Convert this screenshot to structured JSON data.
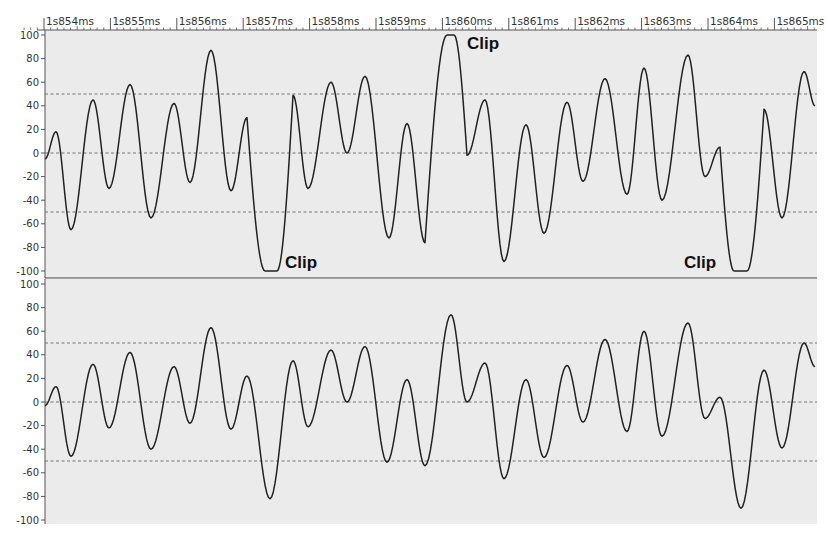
{
  "chart_data": {
    "type": "line",
    "title": "",
    "xlabel": "",
    "ylabel": "",
    "time_axis": {
      "labels": [
        "1s854ms",
        "1s855ms",
        "1s856ms",
        "1s857ms",
        "1s858ms",
        "1s859ms",
        "1s860ms",
        "1s861ms",
        "1s862ms",
        "1s863ms",
        "1s864ms",
        "1s865ms"
      ],
      "minor_ticks_per_major": 10
    },
    "grid": {
      "dashed_reference_lines": [
        50,
        0,
        -50
      ]
    },
    "panels": [
      {
        "name": "clipped-channel",
        "ylim": [
          -100,
          100
        ],
        "yticks": [
          100,
          80,
          60,
          40,
          20,
          0,
          -20,
          -40,
          -60,
          -80,
          -100
        ],
        "annotations": [
          {
            "text": "Clip",
            "at_x_px": 285,
            "at_value": -100
          },
          {
            "text": "Clip",
            "at_x_px": 467,
            "at_value": 100
          },
          {
            "text": "Clip",
            "at_x_px": 684,
            "at_value": -100
          }
        ],
        "points": [
          [
            45,
            -5
          ],
          [
            56,
            18
          ],
          [
            71,
            -65
          ],
          [
            93,
            45
          ],
          [
            109,
            -30
          ],
          [
            130,
            58
          ],
          [
            151,
            -55
          ],
          [
            174,
            42
          ],
          [
            190,
            -25
          ],
          [
            211,
            87
          ],
          [
            231,
            -32
          ],
          [
            247,
            30
          ],
          [
            265,
            -100
          ],
          [
            277,
            -100
          ],
          [
            293,
            49
          ],
          [
            308,
            -30
          ],
          [
            331,
            60
          ],
          [
            347,
            0
          ],
          [
            365,
            65
          ],
          [
            389,
            -72
          ],
          [
            407,
            25
          ],
          [
            425,
            -76
          ],
          [
            447,
            100
          ],
          [
            454,
            100
          ],
          [
            467,
            -2
          ],
          [
            485,
            45
          ],
          [
            504,
            -92
          ],
          [
            526,
            24
          ],
          [
            544,
            -68
          ],
          [
            567,
            43
          ],
          [
            583,
            -24
          ],
          [
            605,
            63
          ],
          [
            627,
            -35
          ],
          [
            644,
            72
          ],
          [
            662,
            -40
          ],
          [
            688,
            83
          ],
          [
            705,
            -20
          ],
          [
            720,
            5
          ],
          [
            734,
            -100
          ],
          [
            747,
            -100
          ],
          [
            764,
            37
          ],
          [
            782,
            -55
          ],
          [
            804,
            69
          ],
          [
            815,
            40
          ]
        ]
      },
      {
        "name": "unclipped-channel",
        "ylim": [
          -100,
          100
        ],
        "yticks": [
          100,
          80,
          60,
          40,
          20,
          0,
          -20,
          -40,
          -60,
          -80,
          -100
        ],
        "annotations": [],
        "points": [
          [
            45,
            -3
          ],
          [
            56,
            13
          ],
          [
            71,
            -46
          ],
          [
            93,
            32
          ],
          [
            109,
            -22
          ],
          [
            130,
            42
          ],
          [
            151,
            -40
          ],
          [
            174,
            30
          ],
          [
            190,
            -18
          ],
          [
            211,
            63
          ],
          [
            231,
            -23
          ],
          [
            247,
            22
          ],
          [
            270,
            -82
          ],
          [
            293,
            35
          ],
          [
            308,
            -21
          ],
          [
            331,
            44
          ],
          [
            347,
            0
          ],
          [
            365,
            47
          ],
          [
            387,
            -51
          ],
          [
            407,
            19
          ],
          [
            425,
            -54
          ],
          [
            451,
            74
          ],
          [
            467,
            0
          ],
          [
            485,
            33
          ],
          [
            504,
            -65
          ],
          [
            526,
            19
          ],
          [
            544,
            -47
          ],
          [
            567,
            31
          ],
          [
            583,
            -17
          ],
          [
            605,
            53
          ],
          [
            627,
            -25
          ],
          [
            644,
            60
          ],
          [
            662,
            -29
          ],
          [
            688,
            67
          ],
          [
            705,
            -14
          ],
          [
            720,
            4
          ],
          [
            741,
            -90
          ],
          [
            764,
            27
          ],
          [
            782,
            -39
          ],
          [
            804,
            50
          ],
          [
            815,
            30
          ]
        ]
      }
    ]
  },
  "labels": {
    "clip": "Clip"
  },
  "colors": {
    "background": "#ececec",
    "axis": "#555555",
    "waveform": "#222222",
    "dashed": "#666666",
    "divider": "#444444"
  }
}
